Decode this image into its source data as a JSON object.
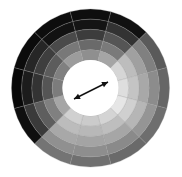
{
  "wheel": {
    "center": [
      90.5,
      88
    ],
    "inner_radius": 28,
    "outer_radius": 79,
    "ring_count": 5,
    "sector_count": 12,
    "start_angle_deg": -105,
    "divider_color": "#9a9a9a",
    "hole_color": "#ffffff",
    "sectors": [
      {
        "name": "top",
        "shades": [
          "#0e0e0e",
          "#141414",
          "#3c3c3c",
          "#6a6a6a",
          "#8f8f8f"
        ]
      },
      {
        "name": "top-right",
        "shades": [
          "#111111",
          "#333333",
          "#555555",
          "#7a7a7a",
          "#a5a5a5"
        ]
      },
      {
        "name": "right-upper",
        "shades": [
          "#5a5a5a",
          "#808080",
          "#a0a0a0",
          "#bdbdbd",
          "#d6d6d6"
        ]
      },
      {
        "name": "right",
        "shades": [
          "#666666",
          "#8c8c8c",
          "#a8a8a8",
          "#c4c4c4",
          "#dedede"
        ]
      },
      {
        "name": "right-lower",
        "shades": [
          "#6e6e6e",
          "#959595",
          "#b6b6b6",
          "#d0d0d0",
          "#e6e6e6"
        ]
      },
      {
        "name": "bottom-right",
        "shades": [
          "#6a6a6a",
          "#8a8a8a",
          "#a6a6a6",
          "#bebebe",
          "#d4d4d4"
        ]
      },
      {
        "name": "bottom",
        "shades": [
          "#707070",
          "#8e8e8e",
          "#a4a4a4",
          "#b8b8b8",
          "#cbcbcb"
        ]
      },
      {
        "name": "bottom-left",
        "shades": [
          "#747474",
          "#909090",
          "#a8a8a8",
          "#bcbcbc",
          "#d0d0d0"
        ]
      },
      {
        "name": "left-lower",
        "shades": [
          "#0f0f0f",
          "#3a3a3a",
          "#5e5e5e",
          "#808080",
          "#a6a6a6"
        ]
      },
      {
        "name": "left",
        "shades": [
          "#080808",
          "#1c1c1c",
          "#333333",
          "#555555",
          "#7c7c7c"
        ]
      },
      {
        "name": "left-upper",
        "shades": [
          "#0b0b0b",
          "#262626",
          "#3e3e3e",
          "#5c5c5c",
          "#808080"
        ]
      },
      {
        "name": "top-left",
        "shades": [
          "#0d0d0d",
          "#121212",
          "#4a4a4a",
          "#787878",
          "#9c9c9c"
        ]
      }
    ],
    "arrow": {
      "from": [
        74,
        99
      ],
      "to": [
        108,
        82
      ],
      "color": "#111111",
      "type": "double-headed"
    }
  }
}
